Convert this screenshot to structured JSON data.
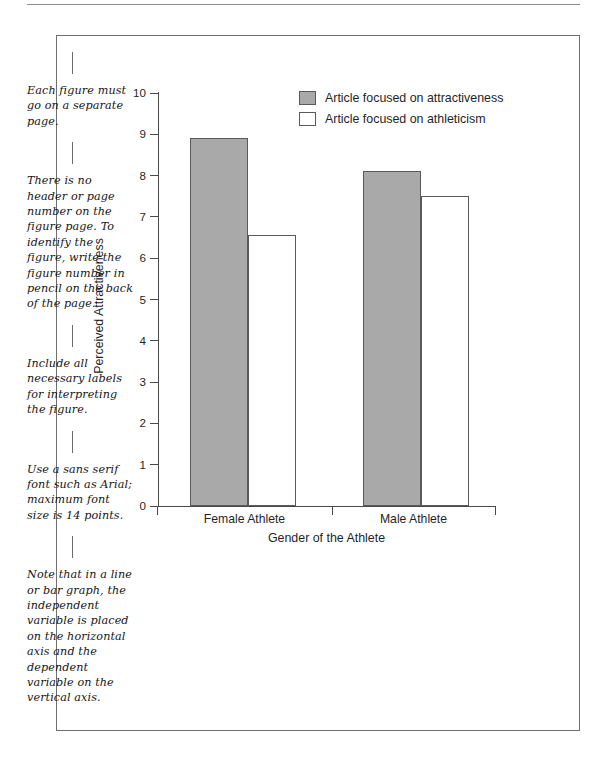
{
  "page": {
    "frame_color": "#6f6f6f",
    "rule_color": "#8d8d8d"
  },
  "annotations": [
    {
      "text": "Each figure must go on a separate page."
    },
    {
      "text": "There is no header or page number on the figure page. To identify the figure, write the figure number in pencil on the back of the page."
    },
    {
      "text": "Include all necessary labels for interpreting the figure."
    },
    {
      "text": "Use a sans serif font such as Arial; maximum font size is 14 points."
    },
    {
      "text": "Note that in a line or bar graph, the independent variable is placed on the horizontal axis and the dependent variable on the vertical axis."
    }
  ],
  "chart_data": {
    "type": "bar",
    "title": "",
    "xlabel": "Gender of the Athlete",
    "ylabel": "Perceived Attractiveness",
    "categories": [
      "Female Athlete",
      "Male Athlete"
    ],
    "series": [
      {
        "name": "Article focused on attractiveness",
        "color": "#a9a9a9",
        "values": [
          8.9,
          8.1
        ]
      },
      {
        "name": "Article focused on athleticism",
        "color": "#ffffff",
        "values": [
          6.55,
          7.5
        ]
      }
    ],
    "ylim": [
      0,
      10
    ],
    "yticks": [
      0,
      1,
      2,
      3,
      4,
      5,
      6,
      7,
      8,
      9,
      10
    ],
    "ytick_labels": [
      "0",
      "1",
      "2",
      "3",
      "4",
      "5",
      "6",
      "7",
      "8",
      "9",
      "10"
    ],
    "grid": false,
    "legend_position": "top-right"
  }
}
